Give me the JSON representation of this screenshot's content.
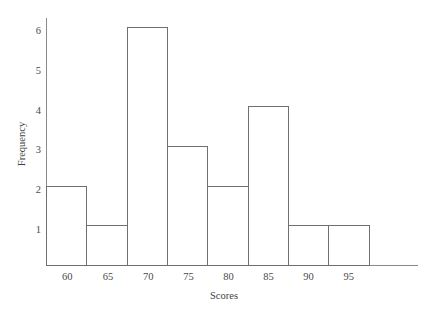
{
  "chart_data": {
    "type": "bar",
    "title": "",
    "xlabel": "Scores",
    "ylabel": "Frequency",
    "categories": [
      "60",
      "65",
      "70",
      "75",
      "80",
      "85",
      "90",
      "95"
    ],
    "values": [
      2,
      1,
      6,
      3,
      2,
      4,
      1,
      1
    ],
    "bin_edges": [
      57.5,
      62.5,
      67.5,
      72.5,
      77.5,
      82.5,
      87.5,
      92.5,
      97.5
    ],
    "bin_width": 5,
    "x_tick_labels": [
      "60",
      "65",
      "70",
      "75",
      "80",
      "85",
      "90",
      "95"
    ],
    "y_tick_labels": [
      "1",
      "2",
      "3",
      "4",
      "5",
      "6"
    ],
    "y_tick_values": [
      1,
      2,
      3,
      4,
      5,
      6
    ],
    "ylim": [
      0,
      6.2
    ],
    "xlim": [
      56,
      101
    ],
    "grid": false,
    "legend": false,
    "legend_position": "none",
    "bar_fill": "#ffffff",
    "bar_stroke": "#6f6f6f",
    "axis_color": "#8a8a8a",
    "text_color": "#3f3f3f",
    "background": "#ffffff"
  },
  "axes": {
    "y_axis_label": "Frequency",
    "x_axis_label": "Scores"
  }
}
